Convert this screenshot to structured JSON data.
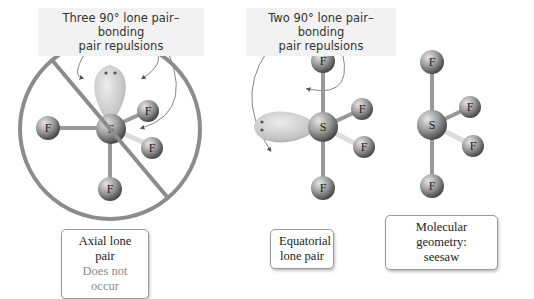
{
  "captions": {
    "left": {
      "line1": "Three 90° lone pair–bonding",
      "line2": "pair repulsions"
    },
    "middle": {
      "line1": "Two 90° lone pair–bonding",
      "line2": "pair repulsions"
    }
  },
  "labels": {
    "axial": {
      "line1": "Axial lone pair",
      "line2": "Does not occur"
    },
    "equatorial": {
      "line1": "Equatorial",
      "line2": "lone pair"
    },
    "geometry": {
      "line1": "Molecular geometry:",
      "line2": "seesaw"
    }
  },
  "atoms": {
    "central": "S",
    "ligand": "F"
  },
  "colors": {
    "prohibition_circle": "#8c8c8c",
    "lone_pair_lobe": "#c8c8c8",
    "atom_sphere": "#8a8a8a",
    "arrow": "#555555"
  },
  "molecules": [
    {
      "name": "axial-lone-pair-sf4",
      "crossed_out": true
    },
    {
      "name": "equatorial-lone-pair-sf4",
      "crossed_out": false
    },
    {
      "name": "seesaw-geometry-sf4",
      "crossed_out": false
    }
  ]
}
